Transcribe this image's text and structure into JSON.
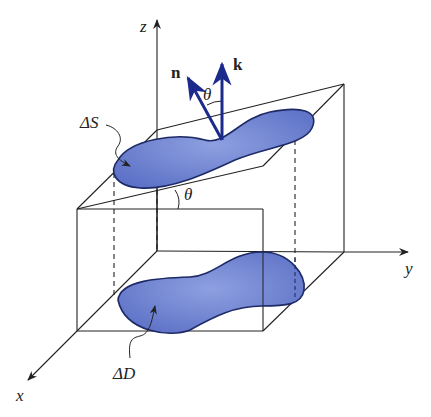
{
  "diagram": {
    "axes": {
      "x": "x",
      "y": "y",
      "z": "z"
    },
    "vectors": {
      "normal": "n",
      "vertical": "k"
    },
    "angles": {
      "between_vectors": "θ",
      "plane_tilt": "θ"
    },
    "regions": {
      "surface_patch": "ΔS",
      "projection": "ΔD"
    },
    "colors": {
      "region_fill": "#6f82d0",
      "region_edge": "#1d2a66",
      "vector": "#1c2a8c",
      "line": "#222222"
    }
  }
}
